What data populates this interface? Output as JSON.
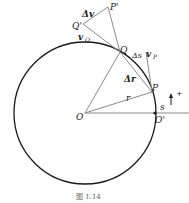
{
  "diagram": {
    "caption": "图 1.14",
    "labels": {
      "O": "O",
      "O_prime": "O'",
      "P": "P",
      "P_prime": "P'",
      "Q": "Q",
      "Q_prime": "Q'",
      "r": "r",
      "s": "s",
      "delta_s": "Δs",
      "delta_r": "Δr",
      "delta_v": "Δv",
      "v": "v",
      "sub_Q": "Q",
      "sub_P": "P",
      "plus": "+"
    },
    "colors": {
      "circle": "#1a1a1a",
      "lines": "#8a8a8a",
      "text": "#222222"
    }
  }
}
